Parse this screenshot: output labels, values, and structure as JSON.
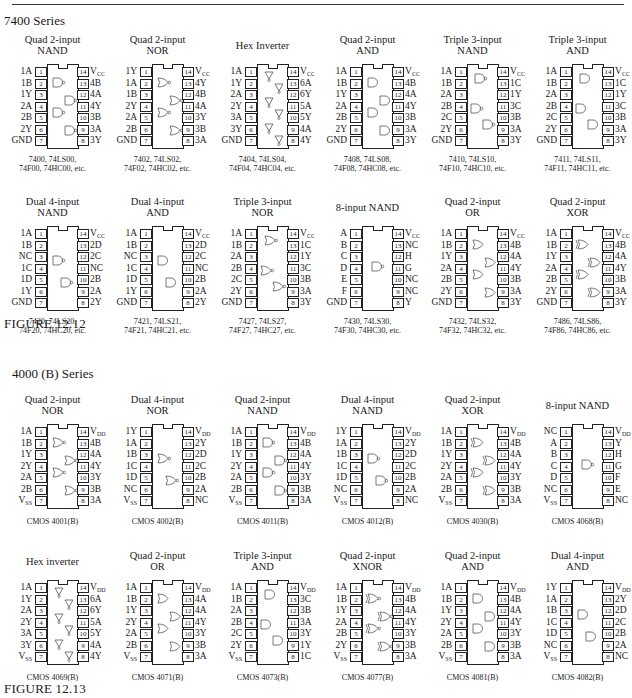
{
  "page": {
    "series_7400": "7400 Series",
    "series_4000": "4000 (B) Series",
    "figure_7400": "FIGURE 12.12",
    "figure_4000": "FIGURE 12.13"
  },
  "chips_7400": [
    {
      "title": [
        "Quad 2-input",
        "NAND"
      ],
      "left": [
        "1A",
        "1B",
        "1Y",
        "2A",
        "2B",
        "2Y",
        "GND"
      ],
      "right": [
        "VCC",
        "4B",
        "4A",
        "4Y",
        "3B",
        "3A",
        "3Y"
      ],
      "caption": [
        "7400, 74LS00,",
        "74F00, 74HC00, etc."
      ],
      "gate": "nand",
      "count": 4
    },
    {
      "title": [
        "Quad 2-input",
        "NOR"
      ],
      "left": [
        "1Y",
        "1A",
        "1B",
        "2Y",
        "2A",
        "2B",
        "GND"
      ],
      "right": [
        "VCC",
        "4Y",
        "4B",
        "4A",
        "3Y",
        "3B",
        "3A"
      ],
      "caption": [
        "7402, 74LS02,",
        "74F02, 74HC02, etc."
      ],
      "gate": "nor",
      "count": 4
    },
    {
      "title": [
        "Hex Inverter"
      ],
      "left": [
        "1A",
        "1Y",
        "2A",
        "2Y",
        "3A",
        "3Y",
        "GND"
      ],
      "right": [
        "VCC",
        "6A",
        "6Y",
        "5A",
        "5Y",
        "4A",
        "4Y"
      ],
      "caption": [
        "7404, 74LS04,",
        "74F04, 74HC04, etc."
      ],
      "gate": "not",
      "count": 6
    },
    {
      "title": [
        "Quad 2-input",
        "AND"
      ],
      "left": [
        "1A",
        "1B",
        "1Y",
        "2A",
        "2B",
        "2Y",
        "GND"
      ],
      "right": [
        "VCC",
        "4B",
        "4A",
        "4Y",
        "3B",
        "3A",
        "3Y"
      ],
      "caption": [
        "7408, 74LS08,",
        "74F08, 74HC08, etc."
      ],
      "gate": "and",
      "count": 4
    },
    {
      "title": [
        "Triple 3-input",
        "NAND"
      ],
      "left": [
        "1A",
        "1B",
        "2A",
        "2B",
        "2C",
        "2Y",
        "GND"
      ],
      "right": [
        "VCC",
        "1C",
        "1Y",
        "3C",
        "3B",
        "3A",
        "3Y"
      ],
      "caption": [
        "7410, 74LS10,",
        "74F10, 74HC10, etc."
      ],
      "gate": "nand",
      "count": 3
    },
    {
      "title": [
        "Triple 3-input",
        "AND"
      ],
      "left": [
        "1A",
        "1B",
        "2A",
        "2B",
        "2C",
        "2Y",
        "GND"
      ],
      "right": [
        "VCC",
        "1C",
        "1Y",
        "3C",
        "3B",
        "3A",
        "3Y"
      ],
      "caption": [
        "7411, 74LS11,",
        "74F11, 74HC11, etc."
      ],
      "gate": "and",
      "count": 3
    },
    {
      "title": [
        "Dual 4-input",
        "NAND"
      ],
      "left": [
        "1A",
        "1B",
        "NC",
        "1C",
        "1D",
        "1Y",
        "GND"
      ],
      "right": [
        "VCC",
        "2D",
        "2C",
        "NC",
        "2B",
        "2A",
        "2Y"
      ],
      "caption": [
        "7420, 74LS20,",
        "74F20, 74HC20, etc."
      ],
      "gate": "nand",
      "count": 2
    },
    {
      "title": [
        "Dual 4-input",
        "AND"
      ],
      "left": [
        "1A",
        "1B",
        "NC",
        "1C",
        "1D",
        "1Y",
        "GND"
      ],
      "right": [
        "VCC",
        "2D",
        "2C",
        "NC",
        "2B",
        "2A",
        "2Y"
      ],
      "caption": [
        "7421, 74LS21,",
        "74F21, 74HC21, etc."
      ],
      "gate": "and",
      "count": 2
    },
    {
      "title": [
        "Triple 3-input",
        "NOR"
      ],
      "left": [
        "1A",
        "1B",
        "2A",
        "2B",
        "2C",
        "2Y",
        "GND"
      ],
      "right": [
        "VCC",
        "1C",
        "1Y",
        "3C",
        "3B",
        "3A",
        "3Y"
      ],
      "caption": [
        "7427, 74LS27,",
        "74F27, 74HC27, etc."
      ],
      "gate": "nor",
      "count": 3
    },
    {
      "title": [
        "8-input NAND"
      ],
      "left": [
        "A",
        "B",
        "C",
        "D",
        "E",
        "F",
        "GND"
      ],
      "right": [
        "VCC",
        "NC",
        "H",
        "G",
        "NC",
        "NC",
        "Y"
      ],
      "caption": [
        "7430, 74LS30,",
        "74F30, 74HC30, etc."
      ],
      "gate": "nand",
      "count": 1
    },
    {
      "title": [
        "Quad 2-input",
        "OR"
      ],
      "left": [
        "1A",
        "1B",
        "1Y",
        "2A",
        "2B",
        "2Y",
        "GND"
      ],
      "right": [
        "VCC",
        "4B",
        "4A",
        "4Y",
        "3B",
        "3A",
        "3Y"
      ],
      "caption": [
        "7432, 74LS32,",
        "74F32, 74HC32, etc."
      ],
      "gate": "or",
      "count": 4
    },
    {
      "title": [
        "Quad 2-input",
        "XOR"
      ],
      "left": [
        "1A",
        "1B",
        "1Y",
        "2A",
        "2B",
        "2Y",
        "GND"
      ],
      "right": [
        "VCC",
        "4B",
        "4A",
        "4Y",
        "3B",
        "3A",
        "3Y"
      ],
      "caption": [
        "7486, 74LS86,",
        "74F86, 74HC86, etc."
      ],
      "gate": "xor",
      "count": 4
    }
  ],
  "chips_4000": [
    {
      "title": [
        "Quad 2-input",
        "NOR"
      ],
      "left": [
        "1A",
        "1B",
        "1Y",
        "2Y",
        "2A",
        "2B",
        "VSS"
      ],
      "right": [
        "VDD",
        "4B",
        "4A",
        "4Y",
        "3Y",
        "3B",
        "3A"
      ],
      "caption": [
        "CMOS 4001(B)"
      ],
      "gate": "nor",
      "count": 4
    },
    {
      "title": [
        "Dual 4-input",
        "NOR"
      ],
      "left": [
        "1Y",
        "1A",
        "1B",
        "1C",
        "1D",
        "NC",
        "VSS"
      ],
      "right": [
        "VDD",
        "2Y",
        "2D",
        "2C",
        "2B",
        "2A",
        "NC"
      ],
      "caption": [
        "CMOS 4002(B)"
      ],
      "gate": "nor",
      "count": 2
    },
    {
      "title": [
        "Quad 2-input",
        "NAND"
      ],
      "left": [
        "1A",
        "1B",
        "1Y",
        "2Y",
        "2A",
        "2B",
        "VSS"
      ],
      "right": [
        "VDD",
        "4B",
        "4A",
        "4Y",
        "3Y",
        "3B",
        "3A"
      ],
      "caption": [
        "CMOS 4011(B)"
      ],
      "gate": "nand",
      "count": 4
    },
    {
      "title": [
        "Dual 4-input",
        "NAND"
      ],
      "left": [
        "1Y",
        "1A",
        "1B",
        "1C",
        "1D",
        "NC",
        "VSS"
      ],
      "right": [
        "VDD",
        "2Y",
        "2D",
        "2C",
        "2B",
        "2A",
        "NC"
      ],
      "caption": [
        "CMOS 4012(B)"
      ],
      "gate": "nand",
      "count": 2
    },
    {
      "title": [
        "Quad 2-input",
        "XOR"
      ],
      "left": [
        "1A",
        "1B",
        "1Y",
        "2Y",
        "2A",
        "2B",
        "VSS"
      ],
      "right": [
        "VDD",
        "4B",
        "4A",
        "4Y",
        "3Y",
        "3B",
        "3A"
      ],
      "caption": [
        "CMOS 4030(B)"
      ],
      "gate": "xor",
      "count": 4
    },
    {
      "title": [
        "8-input NAND"
      ],
      "left": [
        "NC",
        "A",
        "B",
        "C",
        "D",
        "NC",
        "VSS"
      ],
      "right": [
        "VDD",
        "Y",
        "H",
        "G",
        "F",
        "E",
        "NC"
      ],
      "caption": [
        "CMOS 4068(B)"
      ],
      "gate": "nand",
      "count": 1
    },
    {
      "title": [
        "Hex inverter"
      ],
      "left": [
        "1A",
        "1Y",
        "2A",
        "2Y",
        "3A",
        "3Y",
        "VSS"
      ],
      "right": [
        "VDD",
        "6A",
        "6Y",
        "5A",
        "5Y",
        "4A",
        "4Y"
      ],
      "caption": [
        "CMOS 4069(B)"
      ],
      "gate": "not",
      "count": 6
    },
    {
      "title": [
        "Quad 2-input",
        "OR"
      ],
      "left": [
        "1A",
        "1B",
        "1Y",
        "2Y",
        "2A",
        "2B",
        "VSS"
      ],
      "right": [
        "VDD",
        "4A",
        "4A",
        "4Y",
        "3Y",
        "3B",
        "3A"
      ],
      "caption": [
        "CMOS 4071(B)"
      ],
      "gate": "or",
      "count": 4
    },
    {
      "title": [
        "Triple 3-input",
        "AND"
      ],
      "left": [
        "1A",
        "1B",
        "2A",
        "2B",
        "2C",
        "2Y",
        "VSS"
      ],
      "right": [
        "VDD",
        "3C",
        "3B",
        "3A",
        "3Y",
        "1Y",
        "1C"
      ],
      "caption": [
        "CMOS 4073(B)"
      ],
      "gate": "and",
      "count": 3
    },
    {
      "title": [
        "Quad 2-input",
        "XNOR"
      ],
      "left": [
        "1A",
        "1B",
        "1Y",
        "2A",
        "2B",
        "2Y",
        "VSS"
      ],
      "right": [
        "VDD",
        "4B",
        "4A",
        "4Y",
        "3Y",
        "3B",
        "3A"
      ],
      "caption": [
        "CMOS 4077(B)"
      ],
      "gate": "xnor",
      "count": 4
    },
    {
      "title": [
        "Quad 2-input",
        "AND"
      ],
      "left": [
        "1A",
        "1B",
        "1Y",
        "2Y",
        "2A",
        "2B",
        "VSS"
      ],
      "right": [
        "VDD",
        "4B",
        "4A",
        "4Y",
        "3Y",
        "3B",
        "3A"
      ],
      "caption": [
        "CMOS 4081(B)"
      ],
      "gate": "and",
      "count": 4
    },
    {
      "title": [
        "Dual 4-input",
        "AND"
      ],
      "left": [
        "1Y",
        "1A",
        "1B",
        "1C",
        "1D",
        "NC",
        "VSS"
      ],
      "right": [
        "VDD",
        "2Y",
        "2D",
        "2C",
        "2B",
        "2A",
        "NC"
      ],
      "caption": [
        "CMOS 4082(B)"
      ],
      "gate": "and",
      "count": 2
    }
  ]
}
